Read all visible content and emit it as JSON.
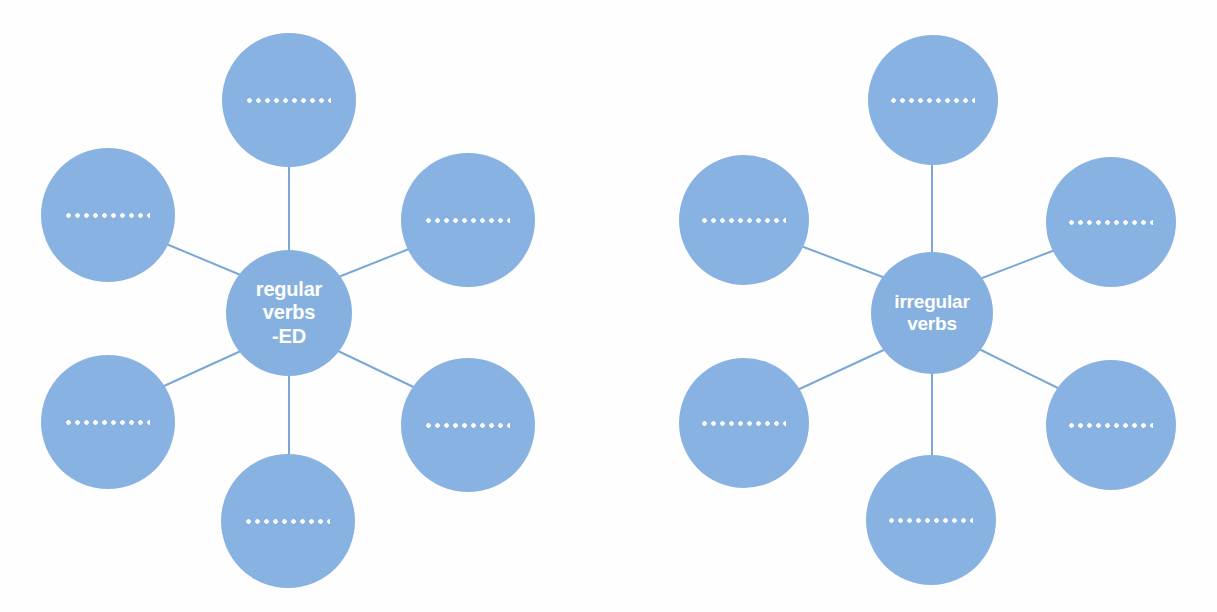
{
  "page": {
    "background_color": "#fefefe",
    "node_color": "#88b2e2",
    "line_color": "#7ba7d6",
    "blank_dot_color": "#ffffff"
  },
  "diagrams": [
    {
      "id": "regular-verbs",
      "center": {
        "lines": [
          "regular",
          "verbs",
          "-ED"
        ],
        "text": "regular verbs -ED"
      },
      "spokes": [
        {
          "position": "top",
          "label": "..........."
        },
        {
          "position": "upper-left",
          "label": "..........."
        },
        {
          "position": "upper-right",
          "label": "..........."
        },
        {
          "position": "lower-left",
          "label": "..........."
        },
        {
          "position": "lower-right",
          "label": "..........."
        },
        {
          "position": "bottom",
          "label": "..........."
        }
      ]
    },
    {
      "id": "irregular-verbs",
      "center": {
        "lines": [
          "irregular",
          "verbs"
        ],
        "text": "irregular verbs"
      },
      "spokes": [
        {
          "position": "top",
          "label": "..........."
        },
        {
          "position": "upper-left",
          "label": "..........."
        },
        {
          "position": "upper-right",
          "label": "..........."
        },
        {
          "position": "lower-left",
          "label": "..........."
        },
        {
          "position": "lower-right",
          "label": "..........."
        },
        {
          "position": "bottom",
          "label": "..........."
        }
      ]
    }
  ]
}
